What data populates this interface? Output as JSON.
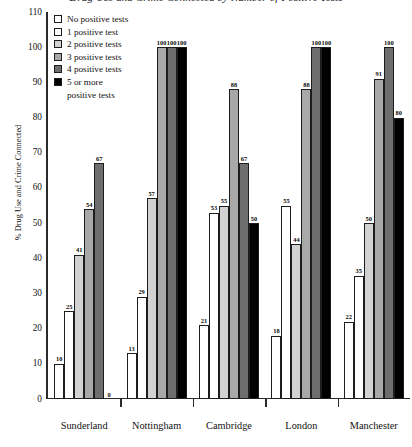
{
  "chart_data": {
    "type": "bar",
    "title": "Drug Use and Crime Connected by Number of Positive Tests",
    "xlabel": "",
    "ylabel": "% Drug Use and Crime Connected",
    "ylim": [
      0,
      110
    ],
    "yticks": [
      0,
      10,
      20,
      30,
      40,
      50,
      60,
      70,
      80,
      90,
      100,
      110
    ],
    "grid": false,
    "legend_position": "top-left",
    "categories": [
      "Sunderland",
      "Nottingham",
      "Cambridge",
      "London",
      "Manchester"
    ],
    "series": [
      {
        "name": "No positive tests",
        "color": "#ffffff",
        "values": [
          10,
          13,
          21,
          18,
          22
        ]
      },
      {
        "name": "1  positive test",
        "color": "#ffffff",
        "values": [
          25,
          29,
          53,
          55,
          35
        ]
      },
      {
        "name": "2  positive tests",
        "color": "#d2d2d2",
        "values": [
          41,
          57,
          55,
          44,
          50
        ]
      },
      {
        "name": "3  positive tests",
        "color": "#a8a8a8",
        "values": [
          54,
          100,
          88,
          88,
          91
        ]
      },
      {
        "name": "4  positive tests",
        "color": "#6e6e6e",
        "values": [
          67,
          100,
          67,
          100,
          100
        ]
      },
      {
        "name": "5  or more positive tests",
        "color": "#000000",
        "values": [
          0,
          100,
          50,
          100,
          80
        ]
      }
    ]
  },
  "legend": {
    "items": [
      {
        "label": "No positive tests",
        "cont": ""
      },
      {
        "label": "1  positive test",
        "cont": ""
      },
      {
        "label": "2  positive tests",
        "cont": ""
      },
      {
        "label": "3  positive tests",
        "cont": ""
      },
      {
        "label": "4  positive tests",
        "cont": ""
      },
      {
        "label": "5  or more",
        "cont": "positive tests"
      }
    ]
  }
}
